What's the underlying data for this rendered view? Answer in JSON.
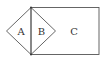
{
  "diagram": {
    "type": "geometric-figure",
    "regions": [
      {
        "id": "A",
        "label": "A",
        "description": "left half of diamond"
      },
      {
        "id": "B",
        "label": "B",
        "description": "right half of diamond"
      },
      {
        "id": "C",
        "label": "C",
        "description": "rectangle region"
      }
    ],
    "colors": {
      "stroke": "#555555",
      "text": "#333333",
      "background": "#ffffff"
    }
  }
}
